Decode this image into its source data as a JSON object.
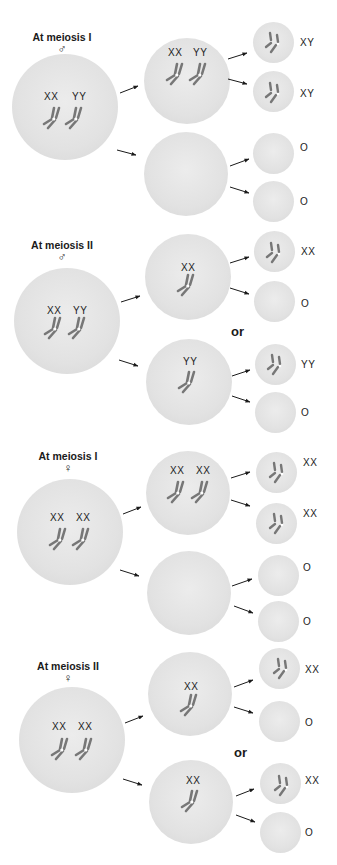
{
  "diagram": {
    "type": "meiotic-nondisjunction",
    "colors": {
      "cell": "#e3e3e3",
      "chromosome": "#7a7a7a",
      "arrow": "#1a1a1a",
      "text": "#1a1a1a"
    },
    "connector_word": "or",
    "panels": [
      {
        "id": "male-meiosis-1",
        "stage_label": "At meiosis I",
        "sex_symbol": "♂",
        "parent_labels": [
          "XX",
          "YY"
        ],
        "daughters": [
          {
            "labels": [
              "XX",
              "YY"
            ],
            "gametes": [
              "XY",
              "XY"
            ]
          },
          {
            "labels": [],
            "gametes": [
              "O",
              "O"
            ]
          }
        ]
      },
      {
        "id": "male-meiosis-2",
        "stage_label": "At meiosis II",
        "sex_symbol": "♂",
        "parent_labels": [
          "XX",
          "YY"
        ],
        "daughters": [
          {
            "labels": [
              "XX"
            ],
            "gametes": [
              "XX",
              "O"
            ]
          },
          {
            "labels": [
              "YY"
            ],
            "gametes": [
              "YY",
              "O"
            ]
          }
        ]
      },
      {
        "id": "female-meiosis-1",
        "stage_label": "At meiosis I",
        "sex_symbol": "♀",
        "parent_labels": [
          "XX",
          "XX"
        ],
        "daughters": [
          {
            "labels": [
              "XX",
              "XX"
            ],
            "gametes": [
              "XX",
              "XX"
            ]
          },
          {
            "labels": [],
            "gametes": [
              "O",
              "O"
            ]
          }
        ]
      },
      {
        "id": "female-meiosis-2",
        "stage_label": "At meiosis II",
        "sex_symbol": "♀",
        "parent_labels": [
          "XX",
          "XX"
        ],
        "daughters": [
          {
            "labels": [
              "XX"
            ],
            "gametes": [
              "XX",
              "O"
            ]
          },
          {
            "labels": [
              "XX"
            ],
            "gametes": [
              "XX",
              "O"
            ]
          }
        ]
      }
    ]
  }
}
